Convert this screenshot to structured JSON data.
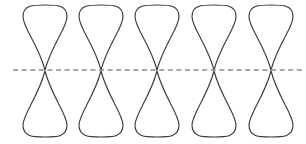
{
  "figure": {
    "background_color": "#ffffff",
    "width": 306,
    "height": 144,
    "shape_count": 10,
    "pair_count": 5,
    "shape_name": "teardrop",
    "outline_color": "#3b3b3b",
    "outline_width": 1.15,
    "fill": "none",
    "axis": {
      "label": "mirror-axis",
      "orientation": "horizontal",
      "color": "#8c8c8c",
      "width": 1.6,
      "dash_pattern": "5 3.6",
      "y": 70,
      "x_start": 13,
      "x_end": 303
    },
    "rows": [
      {
        "name": "top-row",
        "orientation": "point-down",
        "tip_y": 70,
        "dome_y": 5,
        "count": 5,
        "centers_x": [
          45,
          101,
          157,
          214,
          271
        ],
        "half_width": 22
      },
      {
        "name": "bottom-row",
        "orientation": "point-up",
        "tip_y": 71,
        "dome_y": 137,
        "count": 5,
        "centers_x": [
          45,
          101,
          157,
          214,
          271
        ],
        "half_width": 22
      }
    ],
    "shapes": [
      {
        "id": "top-teardrop-1",
        "row": "top-row",
        "index": 1,
        "center_x": 45,
        "tip": [
          45,
          70
        ],
        "orientation": "point-down"
      },
      {
        "id": "top-teardrop-2",
        "row": "top-row",
        "index": 2,
        "center_x": 101,
        "tip": [
          101,
          70
        ],
        "orientation": "point-down"
      },
      {
        "id": "top-teardrop-3",
        "row": "top-row",
        "index": 3,
        "center_x": 157,
        "tip": [
          157,
          70
        ],
        "orientation": "point-down"
      },
      {
        "id": "top-teardrop-4",
        "row": "top-row",
        "index": 4,
        "center_x": 214,
        "tip": [
          214,
          70
        ],
        "orientation": "point-down"
      },
      {
        "id": "top-teardrop-5",
        "row": "top-row",
        "index": 5,
        "center_x": 271,
        "tip": [
          271,
          70
        ],
        "orientation": "point-down"
      },
      {
        "id": "bottom-teardrop-1",
        "row": "bottom-row",
        "index": 1,
        "center_x": 45,
        "tip": [
          45,
          71
        ],
        "orientation": "point-up"
      },
      {
        "id": "bottom-teardrop-2",
        "row": "bottom-row",
        "index": 2,
        "center_x": 101,
        "tip": [
          101,
          71
        ],
        "orientation": "point-up"
      },
      {
        "id": "bottom-teardrop-3",
        "row": "bottom-row",
        "index": 3,
        "center_x": 157,
        "tip": [
          157,
          71
        ],
        "orientation": "point-up"
      },
      {
        "id": "bottom-teardrop-4",
        "row": "bottom-row",
        "index": 4,
        "center_x": 214,
        "tip": [
          214,
          71
        ],
        "orientation": "point-up"
      },
      {
        "id": "bottom-teardrop-5",
        "row": "bottom-row",
        "index": 5,
        "center_x": 271,
        "tip": [
          271,
          71
        ],
        "orientation": "point-up"
      }
    ]
  }
}
